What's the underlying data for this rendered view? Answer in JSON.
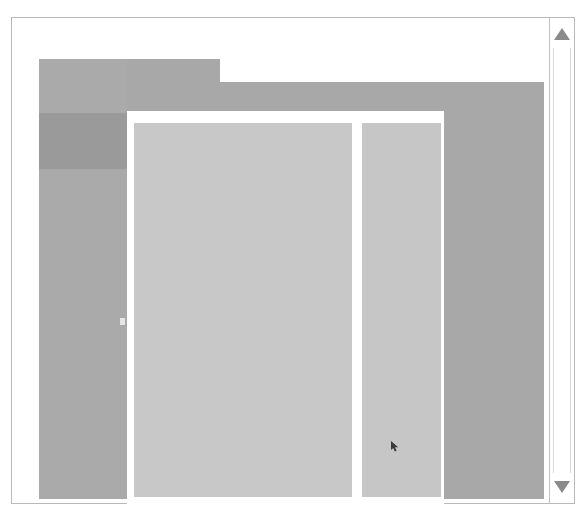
{
  "window": {
    "label": "application-window",
    "chrome_color": "#a8a8a8",
    "frame_border_color": "#b9b9b9",
    "background_color": "#ffffff"
  },
  "tab_bar": {
    "label": "tab-strip",
    "notch_label": "active-tab-notch",
    "notch_color": "#ffffff"
  },
  "sidebar": {
    "label": "navigation-sidebar",
    "background_color": "#aaaaaa",
    "selected_color": "#9a9a9a",
    "handle_color": "#e6e6e6",
    "items": [
      {
        "label": "",
        "name": "sidebar-item-1",
        "top": 0,
        "height": 54,
        "selected": false
      },
      {
        "label": "",
        "name": "sidebar-item-2",
        "top": 54,
        "height": 56,
        "selected": true
      },
      {
        "label": "",
        "name": "sidebar-item-3",
        "top": 110,
        "height": 330,
        "selected": false
      }
    ]
  },
  "content": {
    "label": "content-area",
    "background_color": "#ffffff"
  },
  "main_panel": {
    "label": "main-content-panel",
    "color": "#c8c8c8"
  },
  "side_panel": {
    "label": "detail-panel",
    "color": "#c6c6c6"
  },
  "cursor": {
    "label": "mouse-cursor",
    "color": "#3a3a3a"
  },
  "scrollbar": {
    "label": "vertical-scrollbar",
    "track_color": "#ffffff",
    "arrow_color": "#8a8a8a",
    "up_arrow": "triangle-up-icon",
    "down_arrow": "triangle-down-icon"
  }
}
